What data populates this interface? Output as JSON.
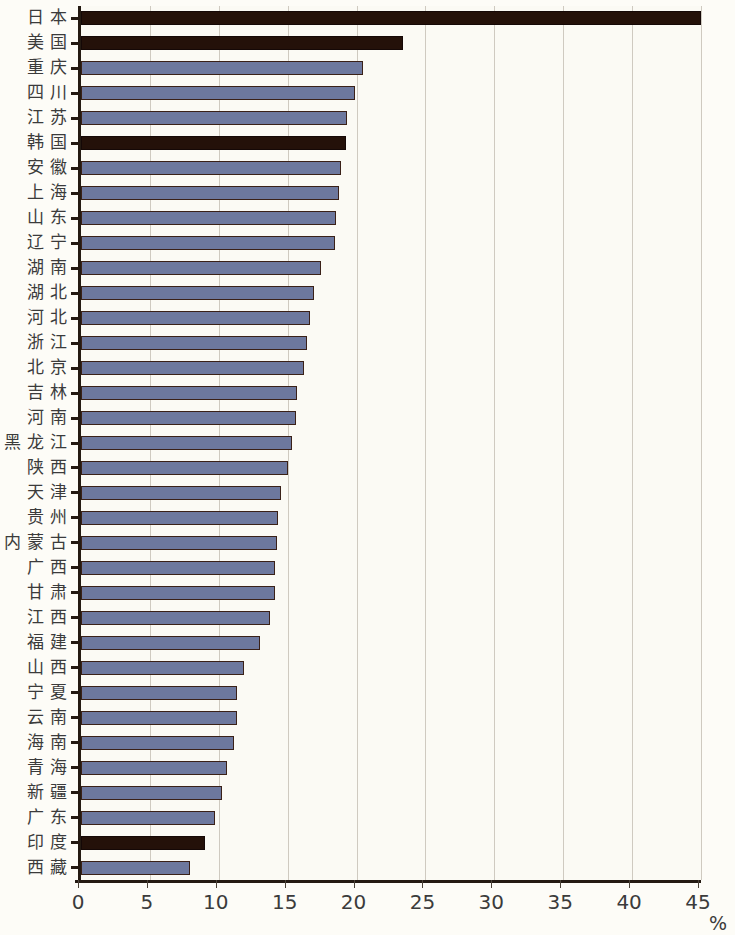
{
  "chart_data": {
    "type": "bar",
    "orientation": "horizontal",
    "title": "",
    "subtitle": "",
    "xlabel": "%",
    "ylabel": "",
    "xlim": [
      0,
      45
    ],
    "xticks": [
      0,
      5,
      10,
      15,
      20,
      25,
      30,
      35,
      40,
      45
    ],
    "xtick_labels": [
      "0",
      "5",
      "10",
      "15",
      "20",
      "25",
      "30",
      "35",
      "40",
      "45"
    ],
    "grid": true,
    "legend": null,
    "categories": [
      "日本",
      "美国",
      "重庆",
      "四川",
      "江苏",
      "韩国",
      "安徽",
      "上海",
      "山东",
      "辽宁",
      "湖南",
      "湖北",
      "河北",
      "浙江",
      "北京",
      "吉林",
      "河南",
      "黑龙江",
      "陕西",
      "天津",
      "贵州",
      "内蒙古",
      "广西",
      "甘肃",
      "江西",
      "福建",
      "山西",
      "宁夏",
      "云南",
      "海南",
      "青海",
      "新疆",
      "广东",
      "印度",
      "西藏"
    ],
    "values": [
      45.0,
      23.4,
      20.5,
      19.9,
      19.3,
      19.2,
      18.9,
      18.7,
      18.5,
      18.4,
      17.4,
      16.9,
      16.6,
      16.4,
      16.2,
      15.7,
      15.6,
      15.3,
      15.0,
      14.5,
      14.3,
      14.2,
      14.1,
      14.1,
      13.7,
      13.0,
      11.8,
      11.3,
      11.3,
      11.1,
      10.6,
      10.2,
      9.7,
      9.0,
      7.9
    ],
    "highlighted_indices": [
      0,
      1,
      5,
      33
    ],
    "colors": {
      "bar_default": "#6d789e",
      "bar_highlight": "#241109",
      "bar_outline": "#3a2118",
      "gridline": "#cfcac0",
      "axis": "#241a12",
      "text": "#3b3b3b",
      "background": "#fbfaf4"
    }
  },
  "axis": {
    "unit_label": "%"
  }
}
